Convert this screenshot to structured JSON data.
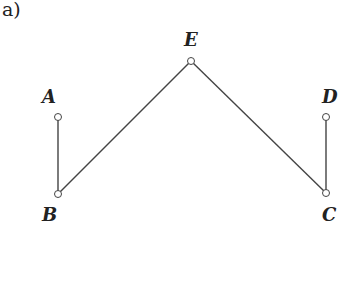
{
  "figure_label": "a)",
  "graph": {
    "nodes": [
      {
        "id": "A",
        "label": "A",
        "x": 58,
        "y": 117,
        "label_x": 42,
        "label_y": 103
      },
      {
        "id": "B",
        "label": "B",
        "x": 58,
        "y": 194,
        "label_x": 42,
        "label_y": 221
      },
      {
        "id": "E",
        "label": "E",
        "x": 191,
        "y": 61,
        "label_x": 184,
        "label_y": 46
      },
      {
        "id": "D",
        "label": "D",
        "x": 326,
        "y": 117,
        "label_x": 322,
        "label_y": 103
      },
      {
        "id": "C",
        "label": "C",
        "x": 326,
        "y": 193,
        "label_x": 322,
        "label_y": 221
      }
    ],
    "edges": [
      {
        "from": "A",
        "to": "B"
      },
      {
        "from": "B",
        "to": "E"
      },
      {
        "from": "E",
        "to": "C"
      },
      {
        "from": "D",
        "to": "C"
      }
    ],
    "stroke_color": "#444444",
    "node_fill": "#ffffff",
    "node_radius": 3.5
  }
}
